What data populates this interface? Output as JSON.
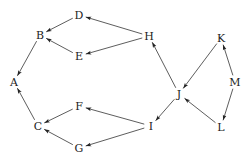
{
  "diagram": {
    "type": "directed-graph",
    "nodes": [
      {
        "id": "A",
        "label": "A",
        "x": 14,
        "y": 82
      },
      {
        "id": "B",
        "label": "B",
        "x": 40,
        "y": 35
      },
      {
        "id": "C",
        "label": "C",
        "x": 38,
        "y": 126
      },
      {
        "id": "D",
        "label": "D",
        "x": 79,
        "y": 15
      },
      {
        "id": "E",
        "label": "E",
        "x": 79,
        "y": 56
      },
      {
        "id": "F",
        "label": "F",
        "x": 79,
        "y": 106
      },
      {
        "id": "G",
        "label": "G",
        "x": 79,
        "y": 148
      },
      {
        "id": "H",
        "label": "H",
        "x": 149,
        "y": 36
      },
      {
        "id": "I",
        "label": "I",
        "x": 151,
        "y": 126
      },
      {
        "id": "J",
        "label": "J",
        "x": 179,
        "y": 94
      },
      {
        "id": "K",
        "label": "K",
        "x": 221,
        "y": 38
      },
      {
        "id": "L",
        "label": "L",
        "x": 221,
        "y": 127
      },
      {
        "id": "M",
        "label": "M",
        "x": 235,
        "y": 82
      }
    ],
    "edges": [
      {
        "from": "B",
        "to": "A"
      },
      {
        "from": "C",
        "to": "A"
      },
      {
        "from": "D",
        "to": "B"
      },
      {
        "from": "E",
        "to": "B"
      },
      {
        "from": "H",
        "to": "D"
      },
      {
        "from": "H",
        "to": "E"
      },
      {
        "from": "F",
        "to": "C"
      },
      {
        "from": "G",
        "to": "C"
      },
      {
        "from": "I",
        "to": "F"
      },
      {
        "from": "I",
        "to": "G"
      },
      {
        "from": "J",
        "to": "H"
      },
      {
        "from": "J",
        "to": "I"
      },
      {
        "from": "K",
        "to": "J"
      },
      {
        "from": "L",
        "to": "J"
      },
      {
        "from": "M",
        "to": "K"
      },
      {
        "from": "M",
        "to": "L"
      }
    ]
  }
}
